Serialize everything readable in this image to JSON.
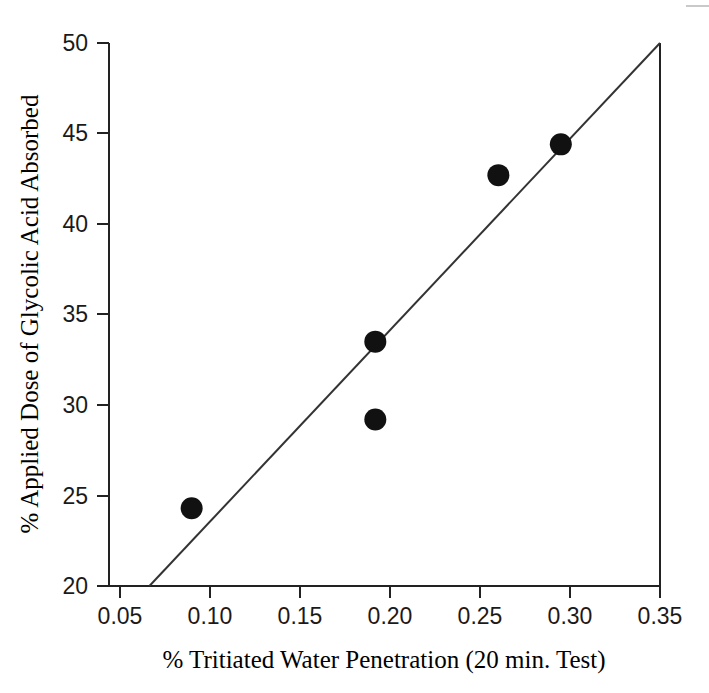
{
  "chart_data": {
    "type": "scatter",
    "title": "",
    "subtitle": "",
    "xlabel": "% Tritiated Water Penetration (20 min. Test)",
    "ylabel": "% Applied Dose of Glycolic Acid Absorbed",
    "xlim": [
      0.05,
      0.35
    ],
    "ylim": [
      20,
      50
    ],
    "xticks": [
      0.05,
      0.1,
      0.15,
      0.2,
      0.25,
      0.3,
      0.35
    ],
    "xtick_labels": [
      "0.05",
      "0.10",
      "0.15",
      "0.20",
      "0.25",
      "0.30",
      "0.35"
    ],
    "yticks": [
      20,
      25,
      30,
      35,
      40,
      45,
      50
    ],
    "ytick_labels": [
      "20",
      "25",
      "30",
      "35",
      "40",
      "45",
      "50"
    ],
    "grid": false,
    "legend": null,
    "legend_position": "none",
    "marker": "filled-circle",
    "marker_color": "#111111",
    "marker_size_px": 22,
    "points": [
      {
        "x": 0.095,
        "y": 24.3
      },
      {
        "x": 0.195,
        "y": 33.5
      },
      {
        "x": 0.195,
        "y": 29.2
      },
      {
        "x": 0.262,
        "y": 42.7
      },
      {
        "x": 0.296,
        "y": 44.4
      }
    ],
    "series": [
      {
        "name": "Observed samples",
        "x": [
          0.095,
          0.195,
          0.195,
          0.262,
          0.296
        ],
        "values": [
          24.3,
          33.5,
          29.2,
          42.7,
          44.4
        ]
      }
    ],
    "trendline": {
      "type": "line",
      "name": "Linear fit",
      "color": "#333333",
      "x_start": 0.072,
      "y_start": 20,
      "x_end": 0.35,
      "y_end": 50,
      "slope": 107.9,
      "intercept": 12.23
    },
    "axes_style": {
      "spines": [
        "left",
        "bottom"
      ],
      "tick_direction": "out",
      "axis_color": "#222222"
    }
  },
  "labels": {
    "x_axis_title": "% Tritiated Water Penetration (20 min. Test)",
    "y_axis_title": "% Applied Dose of Glycolic Acid Absorbed"
  }
}
